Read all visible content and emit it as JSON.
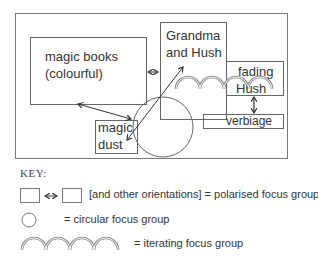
{
  "diagram": {
    "nodes": {
      "magic_books": {
        "line1": "magic books",
        "line2": "(colourful)"
      },
      "grandma": {
        "line1": "Grandma",
        "line2": "and Hush"
      },
      "fading": {
        "line1": "fading",
        "line2": "Hush"
      },
      "magic_dust": {
        "line1": "magic",
        "line2": "dust"
      },
      "verbiage": {
        "label": "verbiage"
      }
    },
    "relations": [
      {
        "from": "magic books (colourful)",
        "to": "Grandma and Hush",
        "type": "polarised"
      },
      {
        "from": "magic books (colourful)",
        "to": "magic dust",
        "type": "polarised"
      },
      {
        "from": "magic dust",
        "to": "Grandma and Hush",
        "type": "polarised"
      },
      {
        "from": "fading Hush",
        "to": "verbiage",
        "type": "polarised"
      },
      {
        "group": [
          "magic dust",
          "Grandma and Hush"
        ],
        "type": "circular"
      },
      {
        "group": [
          "Grandma and Hush",
          "fading Hush"
        ],
        "type": "iterating"
      }
    ]
  },
  "key": {
    "title": "KEY:",
    "polarised": "[and other orientations] = polarised focus group",
    "circular": "= circular focus group",
    "iterating": "= iterating focus group"
  },
  "colors": {
    "line": "#555555",
    "text": "#333333",
    "background": "#ffffff"
  }
}
